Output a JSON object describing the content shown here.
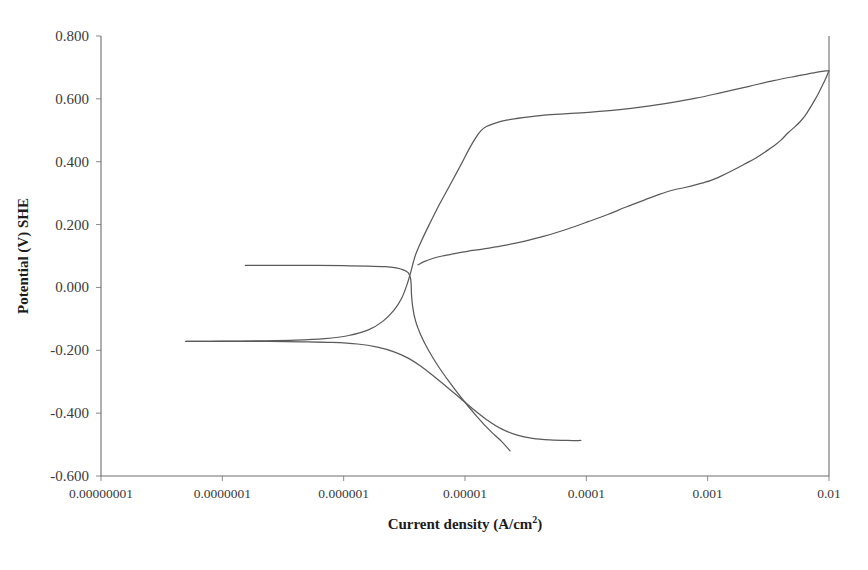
{
  "chart_data": {
    "type": "line",
    "title": "",
    "xlabel": "Current density (A/cm2)",
    "xlabel_base": "Current density (A/cm",
    "xlabel_sup": "2",
    "xlabel_tail": ")",
    "ylabel": "Potential (V) SHE",
    "xscale": "log",
    "xlim": [
      1e-08,
      0.01
    ],
    "ylim": [
      -0.6,
      0.8
    ],
    "grid": false,
    "legend": "none",
    "line_color": "#5a5a5a",
    "axis_color": "#6e6e6e",
    "background": "#ffffff",
    "xticks": [
      1e-08,
      1e-07,
      1e-06,
      1e-05,
      0.0001,
      0.001,
      0.01
    ],
    "xtick_labels": [
      "0.00000001",
      "0.0000001",
      "0.000001",
      "0.00001",
      "0.0001",
      "0.001",
      "0.01"
    ],
    "yticks": [
      0.8,
      0.6,
      0.4,
      0.2,
      0.0,
      -0.2,
      -0.4,
      -0.6
    ],
    "ytick_labels": [
      "0.800",
      "0.600",
      "0.400",
      "0.200",
      "0.000",
      "-0.200",
      "-0.400",
      "-0.600"
    ],
    "series": [
      {
        "name": "forward-anodic-branch",
        "comment": "anodic scan rising from corrosion potential through active peak to passive plateau and transpassive rise",
        "points": [
          [
            1.55e-07,
            0.07
          ],
          [
            2.2e-07,
            0.07
          ],
          [
            3.5e-07,
            0.07
          ],
          [
            6e-07,
            0.07
          ],
          [
            1e-06,
            0.069
          ],
          [
            1.6e-06,
            0.068
          ],
          [
            2.2e-06,
            0.066
          ],
          [
            2.7e-06,
            0.062
          ],
          [
            3.1e-06,
            0.056
          ],
          [
            3.4e-06,
            0.047
          ],
          [
            3.55e-06,
            0.03
          ],
          [
            3.6e-06,
            0.01
          ],
          [
            3.62e-06,
            -0.02
          ],
          [
            3.7e-06,
            -0.06
          ],
          [
            3.9e-06,
            -0.105
          ],
          [
            4.3e-06,
            -0.15
          ],
          [
            5e-06,
            -0.2
          ],
          [
            6e-06,
            -0.25
          ],
          [
            7.4e-06,
            -0.3
          ],
          [
            9.5e-06,
            -0.355
          ],
          [
            1.25e-05,
            -0.41
          ],
          [
            1.6e-05,
            -0.455
          ],
          [
            2e-05,
            -0.49
          ],
          [
            2.35e-05,
            -0.52
          ]
        ]
      },
      {
        "name": "cathodic-branch-lower",
        "comment": "cathodic branch from the second corrosion potential descending to high cathodic current",
        "points": [
          [
            5e-08,
            -0.172
          ],
          [
            8e-08,
            -0.172
          ],
          [
            1.4e-07,
            -0.172
          ],
          [
            2.5e-07,
            -0.172
          ],
          [
            4.5e-07,
            -0.173
          ],
          [
            8e-07,
            -0.175
          ],
          [
            1.3e-06,
            -0.18
          ],
          [
            1.9e-06,
            -0.19
          ],
          [
            2.6e-06,
            -0.205
          ],
          [
            3.4e-06,
            -0.225
          ],
          [
            4.3e-06,
            -0.25
          ],
          [
            5.5e-06,
            -0.282
          ],
          [
            7e-06,
            -0.315
          ],
          [
            9e-06,
            -0.35
          ],
          [
            1.15e-05,
            -0.385
          ],
          [
            1.5e-05,
            -0.42
          ],
          [
            2e-05,
            -0.45
          ],
          [
            2.7e-05,
            -0.47
          ],
          [
            3.6e-05,
            -0.48
          ],
          [
            5e-05,
            -0.485
          ],
          [
            7e-05,
            -0.487
          ],
          [
            9e-05,
            -0.487
          ]
        ]
      },
      {
        "name": "anodic-rise-to-passive",
        "comment": "steep anodic rise from active region crossing up to the passive plateau and transpassive region",
        "points": [
          [
            5e-08,
            -0.172
          ],
          [
            1e-07,
            -0.171
          ],
          [
            2e-07,
            -0.17
          ],
          [
            4e-07,
            -0.168
          ],
          [
            7e-07,
            -0.163
          ],
          [
            1.1e-06,
            -0.153
          ],
          [
            1.6e-06,
            -0.135
          ],
          [
            2.1e-06,
            -0.108
          ],
          [
            2.6e-06,
            -0.072
          ],
          [
            3e-06,
            -0.035
          ],
          [
            3.3e-06,
            0.005
          ],
          [
            3.55e-06,
            0.045
          ],
          [
            3.75e-06,
            0.08
          ],
          [
            3.95e-06,
            0.108
          ],
          [
            4.4e-06,
            0.15
          ],
          [
            5e-06,
            0.195
          ],
          [
            5.8e-06,
            0.245
          ],
          [
            6.8e-06,
            0.295
          ],
          [
            8e-06,
            0.345
          ],
          [
            9.4e-06,
            0.395
          ],
          [
            1.08e-05,
            0.44
          ],
          [
            1.22e-05,
            0.475
          ],
          [
            1.35e-05,
            0.498
          ],
          [
            1.5e-05,
            0.512
          ],
          [
            1.75e-05,
            0.522
          ],
          [
            2.2e-05,
            0.532
          ],
          [
            3e-05,
            0.54
          ],
          [
            4.5e-05,
            0.548
          ],
          [
            7e-05,
            0.553
          ],
          [
            0.00011,
            0.558
          ],
          [
            0.00018,
            0.565
          ],
          [
            0.0003,
            0.575
          ],
          [
            0.0005,
            0.588
          ],
          [
            0.0008,
            0.602
          ],
          [
            0.0013,
            0.62
          ],
          [
            0.0022,
            0.64
          ],
          [
            0.0035,
            0.658
          ],
          [
            0.0055,
            0.673
          ],
          [
            0.0075,
            0.683
          ],
          [
            0.01,
            0.69
          ]
        ]
      },
      {
        "name": "reverse-return-branch",
        "comment": "reverse scan return branch forming the hysteresis loop, rejoining at the highest current",
        "points": [
          [
            4.1e-06,
            0.072
          ],
          [
            4.6e-06,
            0.082
          ],
          [
            5.4e-06,
            0.092
          ],
          [
            6.5e-06,
            0.1
          ],
          [
            8e-06,
            0.107
          ],
          [
            1.05e-05,
            0.115
          ],
          [
            1.4e-05,
            0.122
          ],
          [
            2e-05,
            0.132
          ],
          [
            3e-05,
            0.146
          ],
          [
            4.5e-05,
            0.163
          ],
          [
            7e-05,
            0.186
          ],
          [
            0.000105,
            0.21
          ],
          [
            0.00015,
            0.232
          ],
          [
            0.00021,
            0.255
          ],
          [
            0.0003,
            0.278
          ],
          [
            0.0004,
            0.296
          ],
          [
            0.00052,
            0.31
          ],
          [
            0.00065,
            0.318
          ],
          [
            0.00082,
            0.328
          ],
          [
            0.00105,
            0.34
          ],
          [
            0.0013,
            0.355
          ],
          [
            0.0016,
            0.372
          ],
          [
            0.002,
            0.392
          ],
          [
            0.0025,
            0.412
          ],
          [
            0.003,
            0.432
          ],
          [
            0.0035,
            0.45
          ],
          [
            0.004,
            0.468
          ],
          [
            0.0046,
            0.492
          ],
          [
            0.0052,
            0.51
          ],
          [
            0.0058,
            0.528
          ],
          [
            0.0064,
            0.548
          ],
          [
            0.007,
            0.572
          ],
          [
            0.0076,
            0.595
          ],
          [
            0.0082,
            0.618
          ],
          [
            0.0088,
            0.642
          ],
          [
            0.0094,
            0.665
          ],
          [
            0.01,
            0.69
          ]
        ]
      }
    ]
  },
  "figure": {
    "plot_left": 101,
    "plot_right": 829,
    "plot_top": 36,
    "plot_bottom": 476
  }
}
